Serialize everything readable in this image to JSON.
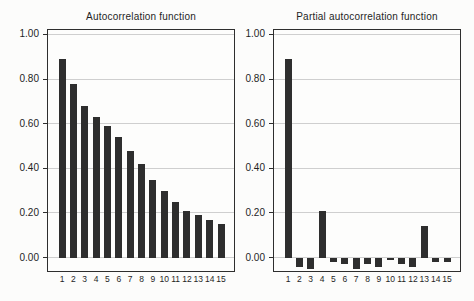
{
  "figure": {
    "background": "#fcfcfb"
  },
  "chart_data": [
    {
      "type": "bar",
      "title": "Autocorrelation function",
      "x": [
        "1",
        "2",
        "3",
        "4",
        "5",
        "6",
        "7",
        "8",
        "9",
        "10",
        "11",
        "12",
        "13",
        "14",
        "15"
      ],
      "values": [
        0.89,
        0.78,
        0.68,
        0.63,
        0.59,
        0.54,
        0.48,
        0.42,
        0.35,
        0.3,
        0.25,
        0.21,
        0.19,
        0.17,
        0.15
      ],
      "xlabel": "",
      "ylabel": "",
      "yticks": [
        0,
        0.2,
        0.4,
        0.6,
        0.8,
        1.0
      ],
      "ytick_labels": [
        "0.00",
        "0.20",
        "0.40",
        "0.60",
        "0.80",
        "1.00"
      ],
      "ylim": [
        -0.06,
        1.02
      ],
      "grid": true,
      "legend": false,
      "bar_color": "#2e2e2e",
      "grid_color": "#cfcfcf",
      "axis_color": "#2e2e2e"
    },
    {
      "type": "bar",
      "title": "Partial autocorrelation function",
      "x": [
        "1",
        "2",
        "3",
        "4",
        "5",
        "6",
        "7",
        "8",
        "9",
        "10",
        "11",
        "12",
        "13",
        "14",
        "15"
      ],
      "values": [
        0.89,
        -0.04,
        -0.05,
        0.21,
        -0.02,
        -0.03,
        -0.05,
        -0.03,
        -0.04,
        -0.01,
        -0.03,
        -0.04,
        0.14,
        -0.02,
        -0.02
      ],
      "xlabel": "",
      "ylabel": "",
      "yticks": [
        0,
        0.2,
        0.4,
        0.6,
        0.8,
        1.0
      ],
      "ytick_labels": [
        "0.00",
        "0.20",
        "0.40",
        "0.60",
        "0.80",
        "1.00"
      ],
      "ylim": [
        -0.06,
        1.02
      ],
      "grid": true,
      "legend": false,
      "bar_color": "#2e2e2e",
      "grid_color": "#cfcfcf",
      "axis_color": "#2e2e2e"
    }
  ]
}
